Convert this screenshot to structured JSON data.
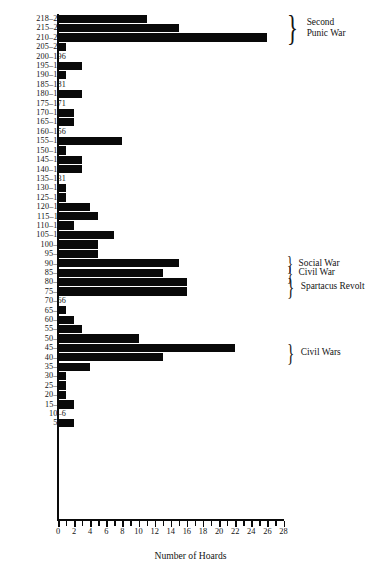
{
  "chart_data": {
    "type": "bar",
    "orientation": "horizontal",
    "title": "",
    "xlabel": "Number of Hoards",
    "ylabel": "",
    "xlim": [
      0,
      28
    ],
    "xticks": [
      0,
      1,
      2,
      3,
      4,
      5,
      6,
      7,
      8,
      9,
      10,
      11,
      12,
      13,
      14,
      15,
      16,
      17,
      18,
      19,
      20,
      21,
      22,
      23,
      24,
      25,
      26,
      27,
      28
    ],
    "xtick_labels": [
      "0",
      "2",
      "4",
      "6",
      "8",
      "10",
      "12",
      "14",
      "16",
      "18",
      "20",
      "22",
      "24",
      "26",
      "28"
    ],
    "xtick_label_values": [
      0,
      2,
      4,
      6,
      8,
      10,
      12,
      14,
      16,
      18,
      20,
      22,
      24,
      26,
      28
    ],
    "grid": false,
    "legend": null,
    "categories": [
      "218–216",
      "215–211",
      "210–206",
      "205–201",
      "200–196",
      "195–191",
      "190–186",
      "185–181",
      "180–176",
      "175–171",
      "170–166",
      "165–161",
      "160–156",
      "155–151",
      "150–146",
      "145–141",
      "140–136",
      "135–131",
      "130–126",
      "125–121",
      "120–116",
      "115–111",
      "110–106",
      "105–101",
      "100–96",
      "95–91",
      "90–86",
      "85–81",
      "80–76",
      "75–71",
      "70–66",
      "65–61",
      "60–56",
      "55–51",
      "50–46",
      "45–41",
      "40–36",
      "35–31",
      "30–26",
      "25–21",
      "20–16",
      "15–11",
      "10–6",
      "5–3"
    ],
    "values": [
      11,
      15,
      26,
      1,
      0,
      3,
      1,
      0,
      3,
      0,
      2,
      2,
      0,
      8,
      1,
      3,
      3,
      0,
      1,
      1,
      4,
      5,
      2,
      7,
      5,
      5,
      15,
      13,
      16,
      16,
      0,
      1,
      2,
      3,
      10,
      22,
      13,
      4,
      1,
      1,
      1,
      2,
      0,
      2
    ],
    "annotations": [
      {
        "id": "second-punic-war",
        "lines": [
          "Second",
          "Punic War"
        ],
        "from_category": "218–216",
        "to_category": "210–206"
      },
      {
        "id": "social-war",
        "lines": [
          "Social War"
        ],
        "from_category": "90–86",
        "to_category": "90–86"
      },
      {
        "id": "civil-war",
        "lines": [
          "Civil War"
        ],
        "from_category": "85–81",
        "to_category": "85–81"
      },
      {
        "id": "spartacus-revolt",
        "lines": [
          "Spartacus Revolt"
        ],
        "from_category": "80–76",
        "to_category": "75–71"
      },
      {
        "id": "civil-wars",
        "lines": [
          "Civil Wars"
        ],
        "from_category": "45–41",
        "to_category": "40–36"
      }
    ],
    "colors": {
      "bar": "#090909",
      "axis": "#0a0a0a",
      "text": "#141414",
      "background": "#ffffff"
    }
  }
}
